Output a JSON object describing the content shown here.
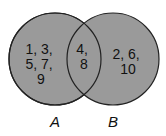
{
  "diagram": {
    "type": "venn",
    "fill_color": "#9a9a9a",
    "stroke_color": "#222222",
    "sets": [
      {
        "label": "A",
        "only_lines": [
          "1, 3,",
          "5, 7,",
          "9"
        ]
      },
      {
        "label": "B",
        "only_lines": [
          "2, 6,",
          "10"
        ]
      }
    ],
    "intersection_lines": [
      "4,",
      "8"
    ]
  }
}
